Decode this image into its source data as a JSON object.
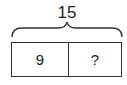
{
  "diagram": {
    "type": "tape-diagram",
    "total": "15",
    "parts": [
      {
        "label": "9"
      },
      {
        "label": "?"
      }
    ],
    "stroke_color": "#333333"
  }
}
